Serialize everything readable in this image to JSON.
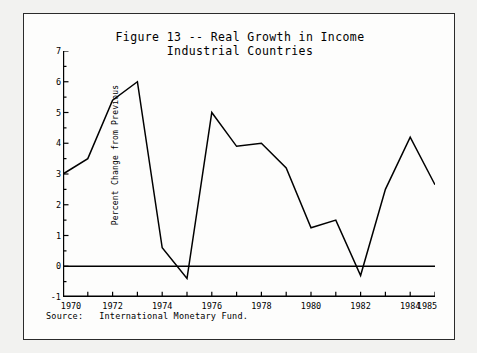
{
  "figure": {
    "title_line_1": "Figure 13 -- Real Growth in Income",
    "title_line_2": "Industrial Countries",
    "source_note": "Source:   International Monetary Fund."
  },
  "chart_data": {
    "type": "line",
    "title": "Figure 13 -- Real Growth in Income",
    "subtitle": "Industrial Countries",
    "xlabel": "",
    "ylabel": "Percent Change from Previous",
    "x": [
      1970,
      1971,
      1972,
      1973,
      1974,
      1975,
      1976,
      1977,
      1978,
      1979,
      1980,
      1981,
      1982,
      1983,
      1984,
      1985
    ],
    "values": [
      3.0,
      3.5,
      5.4,
      6.0,
      0.6,
      -0.4,
      5.0,
      3.9,
      4.0,
      3.2,
      1.25,
      1.5,
      -0.3,
      2.5,
      4.2,
      2.65
    ],
    "xlim": [
      1970,
      1985
    ],
    "ylim": [
      -1,
      7
    ],
    "y_ticks": [
      7,
      6,
      5,
      4,
      3,
      2,
      1,
      0,
      -1
    ],
    "y_tick_labels": [
      "7",
      "6",
      "5",
      "4",
      "3",
      "2",
      "1",
      "0",
      "-1"
    ],
    "x_ticks": [
      1970,
      1971,
      1972,
      1973,
      1974,
      1975,
      1976,
      1977,
      1978,
      1979,
      1980,
      1981,
      1982,
      1983,
      1984,
      1985
    ],
    "x_tick_labels": [
      {
        "x": 1970,
        "label": "1970"
      },
      {
        "x": 1972,
        "label": "1972"
      },
      {
        "x": 1974,
        "label": "1974"
      },
      {
        "x": 1976,
        "label": "1976"
      },
      {
        "x": 1978,
        "label": "1978"
      },
      {
        "x": 1980,
        "label": "1980"
      },
      {
        "x": 1982,
        "label": "1982"
      },
      {
        "x": 1984,
        "label": "1984"
      },
      {
        "x": 1985,
        "label": "1985"
      }
    ],
    "zero_line": 0,
    "grid": false,
    "legend": null,
    "line_color": "#000000",
    "axis_color": "#000000"
  }
}
